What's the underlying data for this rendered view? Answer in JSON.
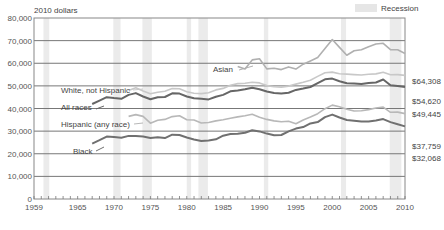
{
  "chart_data": {
    "type": "line",
    "title": "",
    "ylabel": "2010 dollars",
    "xlabel": "",
    "xlim": [
      1959,
      2010
    ],
    "ylim": [
      0,
      80000
    ],
    "grid": true,
    "y_ticks": [
      "0",
      "10,000",
      "20,000",
      "30,000",
      "40,000",
      "50,000",
      "60,000",
      "70,000",
      "80,000"
    ],
    "y_tick_values": [
      0,
      10000,
      20000,
      30000,
      40000,
      50000,
      60000,
      70000,
      80000
    ],
    "x_ticks": [
      "1959",
      "1965",
      "1970",
      "1975",
      "1980",
      "1985",
      "1990",
      "1995",
      "2000",
      "2005",
      "2010"
    ],
    "x_tick_values": [
      1959,
      1965,
      1970,
      1975,
      1980,
      1985,
      1990,
      1995,
      2000,
      2005,
      2010
    ],
    "legend": {
      "label": "Recession",
      "placement": "top-right"
    },
    "recessions": [
      [
        1960.3,
        1961.1
      ],
      [
        1969.9,
        1970.9
      ],
      [
        1973.9,
        1975.2
      ],
      [
        1980.0,
        1980.6
      ],
      [
        1981.6,
        1982.9
      ],
      [
        1990.6,
        1991.2
      ],
      [
        2001.2,
        2001.9
      ],
      [
        2007.9,
        2009.5
      ]
    ],
    "series": [
      {
        "name": "Asian",
        "label": "Asian",
        "end_label": "$64,308",
        "color": "#b0b0b0",
        "x": [
          1987,
          1988,
          1989,
          1990,
          1991,
          1992,
          1993,
          1994,
          1995,
          1996,
          1997,
          1998,
          1999,
          2000,
          2001,
          2002,
          2003,
          2004,
          2005,
          2006,
          2007,
          2008,
          2009,
          2010
        ],
        "values": [
          58500,
          57500,
          61500,
          62000,
          57500,
          57800,
          57200,
          58400,
          57400,
          59600,
          61000,
          62500,
          66500,
          70500,
          67000,
          63500,
          65500,
          66000,
          67300,
          68500,
          68800,
          66000,
          66000,
          64308
        ]
      },
      {
        "name": "White, not Hispanic",
        "label": "White, not Hispanic",
        "end_label": "$54,620",
        "color": "#c8c8c8",
        "x": [
          1972,
          1973,
          1974,
          1975,
          1976,
          1977,
          1978,
          1979,
          1980,
          1981,
          1982,
          1983,
          1984,
          1985,
          1986,
          1987,
          1988,
          1989,
          1990,
          1991,
          1992,
          1993,
          1994,
          1995,
          1996,
          1997,
          1998,
          1999,
          2000,
          2001,
          2002,
          2003,
          2004,
          2005,
          2006,
          2007,
          2008,
          2009,
          2010
        ],
        "values": [
          48000,
          49200,
          47800,
          46500,
          47200,
          47600,
          48800,
          48700,
          47400,
          46700,
          46600,
          47000,
          48200,
          48900,
          50300,
          51000,
          51200,
          51600,
          51300,
          50100,
          49600,
          49400,
          49900,
          50800,
          51600,
          52500,
          54200,
          55800,
          56100,
          55400,
          55200,
          55000,
          54800,
          55100,
          55300,
          56000,
          54900,
          55000,
          54620
        ]
      },
      {
        "name": "All races",
        "label": "All races",
        "end_label": "$49,445",
        "color": "#666666",
        "x": [
          1967,
          1968,
          1969,
          1970,
          1971,
          1972,
          1973,
          1974,
          1975,
          1976,
          1977,
          1978,
          1979,
          1980,
          1981,
          1982,
          1983,
          1984,
          1985,
          1986,
          1987,
          1988,
          1989,
          1990,
          1991,
          1992,
          1993,
          1994,
          1995,
          1996,
          1997,
          1998,
          1999,
          2000,
          2001,
          2002,
          2003,
          2004,
          2005,
          2006,
          2007,
          2008,
          2009,
          2010
        ],
        "values": [
          42000,
          43500,
          45000,
          44600,
          44300,
          46000,
          46800,
          45300,
          44100,
          45000,
          45100,
          46700,
          46600,
          45300,
          44500,
          44300,
          44000,
          45200,
          46000,
          47600,
          48000,
          48500,
          49200,
          48500,
          47500,
          46800,
          46600,
          47000,
          48200,
          48800,
          49500,
          51200,
          52900,
          53200,
          52000,
          51200,
          51000,
          50800,
          51300,
          51500,
          52800,
          50300,
          50000,
          49445
        ]
      },
      {
        "name": "Hispanic (any race)",
        "label": "Hispanic (any race)",
        "end_label": "$37,759",
        "color": "#b8b8b8",
        "x": [
          1972,
          1973,
          1974,
          1975,
          1976,
          1977,
          1978,
          1979,
          1980,
          1981,
          1982,
          1983,
          1984,
          1985,
          1986,
          1987,
          1988,
          1989,
          1990,
          1991,
          1992,
          1993,
          1994,
          1995,
          1996,
          1997,
          1998,
          1999,
          2000,
          2001,
          2002,
          2003,
          2004,
          2005,
          2006,
          2007,
          2008,
          2009,
          2010
        ],
        "values": [
          36500,
          37300,
          36500,
          33500,
          34800,
          35200,
          36400,
          36800,
          35000,
          34900,
          33600,
          33800,
          34500,
          35000,
          35700,
          36300,
          36800,
          37500,
          36100,
          35200,
          34500,
          34100,
          34400,
          33300,
          34900,
          36200,
          37700,
          39900,
          41500,
          40800,
          39700,
          38900,
          39000,
          39500,
          40200,
          40600,
          38300,
          38400,
          37759
        ]
      },
      {
        "name": "Black",
        "label": "Black",
        "end_label": "$32,068",
        "color": "#707070",
        "x": [
          1967,
          1968,
          1969,
          1970,
          1971,
          1972,
          1973,
          1974,
          1975,
          1976,
          1977,
          1978,
          1979,
          1980,
          1981,
          1982,
          1983,
          1984,
          1985,
          1986,
          1987,
          1988,
          1989,
          1990,
          1991,
          1992,
          1993,
          1994,
          1995,
          1996,
          1997,
          1998,
          1999,
          2000,
          2001,
          2002,
          2003,
          2004,
          2005,
          2006,
          2007,
          2008,
          2009,
          2010
        ],
        "values": [
          24500,
          26000,
          27600,
          27400,
          27100,
          27900,
          27800,
          27600,
          27000,
          27300,
          26900,
          28400,
          28300,
          27200,
          26300,
          25600,
          25800,
          26400,
          28000,
          28700,
          28800,
          29300,
          30400,
          29900,
          28900,
          28200,
          28300,
          29900,
          31100,
          31800,
          33400,
          34000,
          36200,
          37300,
          36000,
          34900,
          34600,
          34200,
          34300,
          34700,
          35300,
          34000,
          33000,
          32068
        ]
      }
    ]
  }
}
